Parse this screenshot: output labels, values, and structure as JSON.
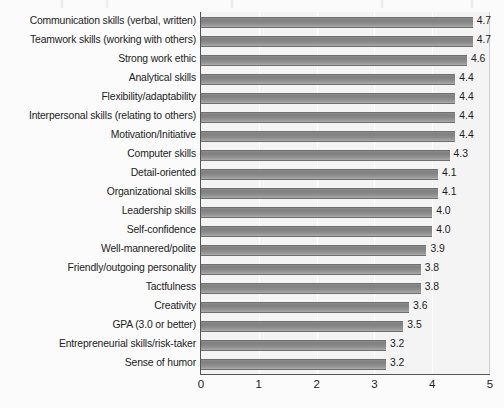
{
  "chart_data": {
    "type": "bar",
    "orientation": "horizontal",
    "title": "",
    "xlabel": "",
    "ylabel": "",
    "xlim": [
      0,
      5
    ],
    "xticks": [
      "0",
      "1",
      "2",
      "3",
      "4",
      "5"
    ],
    "grid": true,
    "legend": null,
    "bar_color": "#8a8a8a",
    "categories": [
      "Communication skills (verbal, written)",
      "Teamwork skills (working with others)",
      "Strong work ethic",
      "Analytical skills",
      "Flexibility/adaptability",
      "Interpersonal skills (relating to others)",
      "Motivation/Initiative",
      "Computer skills",
      "Detail-oriented",
      "Organizational skills",
      "Leadership skills",
      "Self-confidence",
      "Well-mannered/polite",
      "Friendly/outgoing personality",
      "Tactfulness",
      "Creativity",
      "GPA (3.0 or better)",
      "Entrepreneurial skills/risk-taker",
      "Sense of humor"
    ],
    "values": [
      4.7,
      4.7,
      4.6,
      4.4,
      4.4,
      4.4,
      4.4,
      4.3,
      4.1,
      4.1,
      4.0,
      4.0,
      3.9,
      3.8,
      3.8,
      3.6,
      3.5,
      3.2,
      3.2
    ],
    "value_labels": [
      "4.7",
      "4.7",
      "4.6",
      "4.4",
      "4.4",
      "4.4",
      "4.4",
      "4.3",
      "4.1",
      "4.1",
      "4.0",
      "4.0",
      "3.9",
      "3.8",
      "3.8",
      "3.6",
      "3.5",
      "3.2",
      "3.2"
    ]
  }
}
